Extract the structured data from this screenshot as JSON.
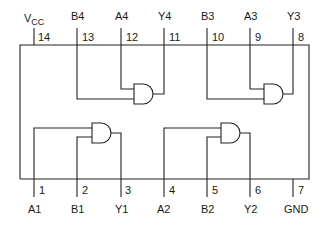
{
  "diagram": {
    "top_pins": [
      {
        "number": "14",
        "label": "V",
        "sub": "CC",
        "x": 34
      },
      {
        "number": "13",
        "label": "B4",
        "x": 77
      },
      {
        "number": "12",
        "label": "A4",
        "x": 121
      },
      {
        "number": "11",
        "label": "Y4",
        "x": 164
      },
      {
        "number": "10",
        "label": "B3",
        "x": 207
      },
      {
        "number": "9",
        "label": "A3",
        "x": 250
      },
      {
        "number": "8",
        "label": "Y3",
        "x": 293
      }
    ],
    "bottom_pins": [
      {
        "number": "1",
        "label": "A1",
        "x": 34
      },
      {
        "number": "2",
        "label": "B1",
        "x": 77
      },
      {
        "number": "3",
        "label": "Y1",
        "x": 121
      },
      {
        "number": "4",
        "label": "A2",
        "x": 164
      },
      {
        "number": "5",
        "label": "B2",
        "x": 207
      },
      {
        "number": "6",
        "label": "Y2",
        "x": 250
      },
      {
        "number": "7",
        "label": "GND",
        "x": 293
      }
    ],
    "gates": [
      {
        "name": "gate-4",
        "inputs": [
          "A4",
          "B4"
        ],
        "output": "Y4"
      },
      {
        "name": "gate-3",
        "inputs": [
          "A3",
          "B3"
        ],
        "output": "Y3"
      },
      {
        "name": "gate-1",
        "inputs": [
          "A1",
          "B1"
        ],
        "output": "Y1"
      },
      {
        "name": "gate-2",
        "inputs": [
          "A2",
          "B2"
        ],
        "output": "Y2"
      }
    ],
    "line_color": "#222222"
  }
}
